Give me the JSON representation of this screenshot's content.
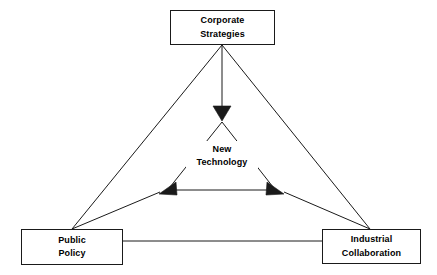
{
  "diagram": {
    "type": "triangle-relationship-diagram",
    "background_color": "#ffffff",
    "line_color": "#1a1a1a",
    "text_color": "#000000",
    "nodes": [
      {
        "id": "corporate-strategies",
        "lines": [
          "Corporate",
          "Strategies"
        ],
        "line1": "Corporate",
        "line2": "Strategies",
        "shape": "rectangle",
        "position": "top"
      },
      {
        "id": "public-policy",
        "lines": [
          "Public",
          "Policy"
        ],
        "line1": "Public",
        "line2": "Policy",
        "shape": "rectangle",
        "position": "bottom-left"
      },
      {
        "id": "industrial-collaboration",
        "lines": [
          "Industrial",
          "Collaboration"
        ],
        "line1": "Industrial",
        "line2": "Collaboration",
        "shape": "rectangle",
        "position": "bottom-right"
      },
      {
        "id": "new-technology",
        "lines": [
          "New",
          "Technology"
        ],
        "line1": "New",
        "line2": "Technology",
        "shape": "none",
        "position": "center"
      }
    ],
    "connectors": [
      {
        "id": "corporate-to-center",
        "from": "corporate-strategies",
        "to": "new-technology",
        "arrow": "end",
        "style": "solid"
      },
      {
        "id": "public-policy-to-center",
        "from": "public-policy",
        "to": "new-technology",
        "arrow": "end",
        "style": "solid"
      },
      {
        "id": "industrial-collaboration-to-center",
        "from": "industrial-collaboration",
        "to": "new-technology",
        "arrow": "end",
        "style": "solid"
      },
      {
        "id": "corporate-to-public-policy",
        "from": "corporate-strategies",
        "to": "public-policy",
        "arrow": "none",
        "style": "solid"
      },
      {
        "id": "corporate-to-industrial-collaboration",
        "from": "corporate-strategies",
        "to": "industrial-collaboration",
        "arrow": "none",
        "style": "solid"
      },
      {
        "id": "public-policy-to-industrial-collaboration",
        "from": "public-policy",
        "to": "industrial-collaboration",
        "arrow": "none",
        "style": "solid"
      }
    ]
  }
}
